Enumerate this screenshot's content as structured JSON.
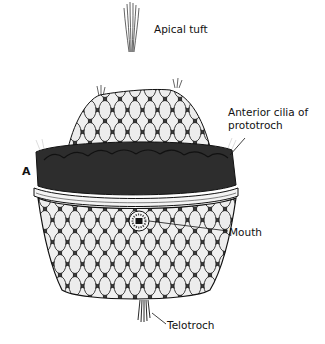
{
  "figure": {
    "panel_letter": "A",
    "labels": {
      "apical_tuft": "Apical tuft",
      "anterior_cilia_line1": "Anterior cilia of",
      "anterior_cilia_line2": "prototroch",
      "mouth": "Mouth",
      "telotroch": "Telotroch"
    },
    "colors": {
      "ink": "#111111",
      "background": "#ffffff",
      "cell_fill": "#f2f2f2",
      "band_dark": "#1a1a1a"
    }
  }
}
